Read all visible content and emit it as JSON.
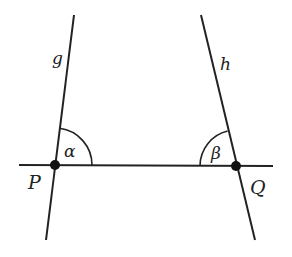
{
  "diagram": {
    "lines": [
      {
        "name": "g",
        "label": "g"
      },
      {
        "name": "h",
        "label": "h"
      }
    ],
    "points": [
      {
        "name": "P",
        "label": "P"
      },
      {
        "name": "Q",
        "label": "Q"
      }
    ],
    "angles": [
      {
        "name": "alpha",
        "label": "α",
        "at": "P"
      },
      {
        "name": "beta",
        "label": "β",
        "at": "Q"
      }
    ],
    "colors": {
      "stroke": "#222222",
      "background": "#ffffff"
    }
  }
}
